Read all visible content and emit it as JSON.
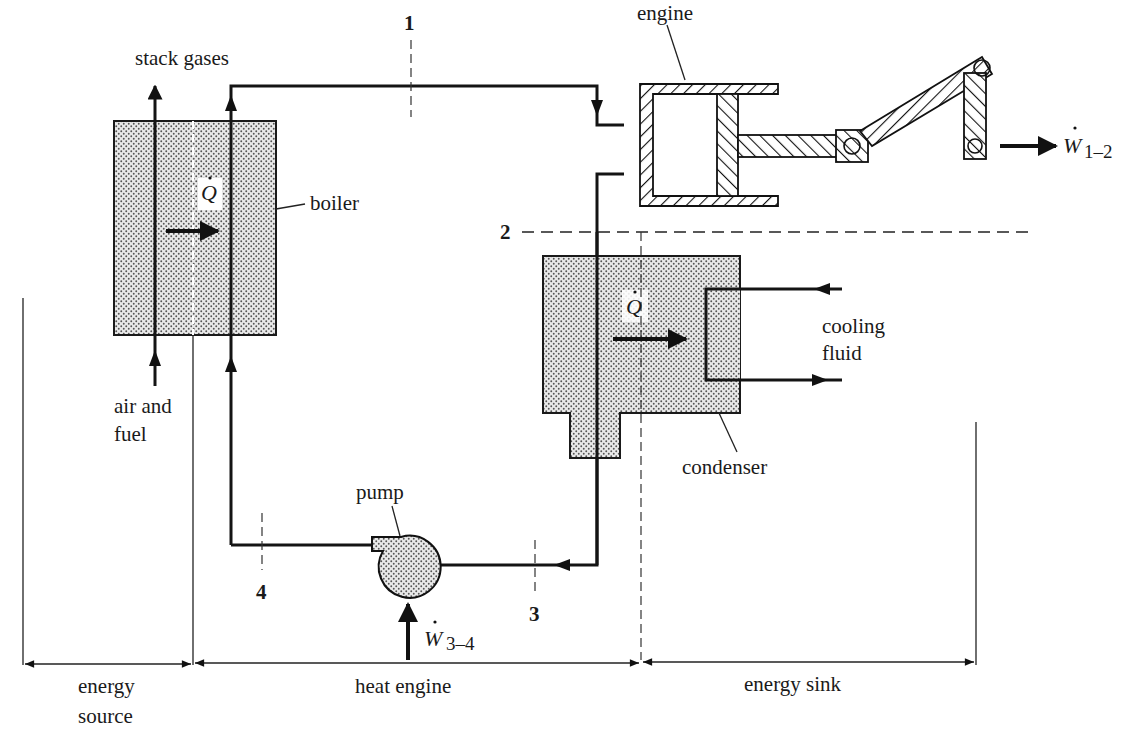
{
  "figure": {
    "type": "schematic"
  },
  "components": {
    "boiler": {
      "label": "boiler"
    },
    "engine": {
      "label": "engine"
    },
    "condenser": {
      "label": "condenser"
    },
    "pump": {
      "label": "pump"
    }
  },
  "streams": {
    "stack_gases": "stack gases",
    "air_fuel_line1": "air and",
    "air_fuel_line2": "fuel",
    "cooling_line1": "cooling",
    "cooling_line2": "fluid"
  },
  "state_points": {
    "p1": "1",
    "p2": "2",
    "p3": "3",
    "p4": "4"
  },
  "energy_terms": {
    "q_boiler": "Q",
    "q_condenser": "Q",
    "w_engine_symbol": "W",
    "w_engine_sub": "1–2",
    "w_pump_symbol": "W",
    "w_pump_sub": "3–4"
  },
  "regions": {
    "source_line1": "energy",
    "source_line2": "source",
    "engine": "heat engine",
    "sink": "energy sink"
  },
  "colors": {
    "ink": "#141414",
    "background": "#ffffff",
    "stipple": "#6a6a6a"
  }
}
